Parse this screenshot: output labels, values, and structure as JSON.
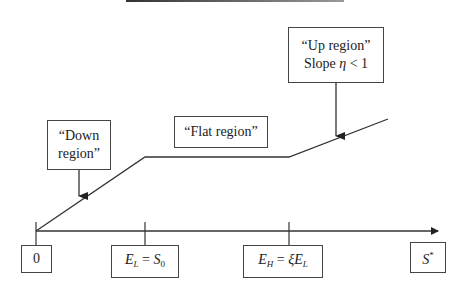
{
  "diagram": {
    "type": "piecewise-linear-function",
    "colors": {
      "line": "#333333",
      "box_border": "#444444",
      "background": "#ffffff"
    },
    "callouts": {
      "down": {
        "line1": "“Down",
        "line2": "region”"
      },
      "flat": {
        "label": "“Flat region”"
      },
      "up": {
        "line1": "“Up region”",
        "line2_prefix": "Slope ",
        "line2_symbol": "η",
        "line2_suffix": " < 1"
      }
    },
    "axis_labels": {
      "origin": "0",
      "el": {
        "main": "E",
        "sub": "L",
        "eq": " = ",
        "rhs": "S",
        "rhs_sub": "0"
      },
      "eh": {
        "main": "E",
        "sub": "H",
        "eq": " = ",
        "rhs_greek": "ξ",
        "rhs": "E",
        "rhs_sub": "L"
      },
      "sstar": {
        "main": "S",
        "sup": "*"
      }
    },
    "segments": [
      {
        "name": "down",
        "from": "0",
        "to": "E_L",
        "slope": "positive"
      },
      {
        "name": "flat",
        "from": "E_L",
        "to": "E_H",
        "slope": "0"
      },
      {
        "name": "up",
        "from": "E_H",
        "to": "beyond",
        "slope": "eta < 1"
      }
    ]
  }
}
